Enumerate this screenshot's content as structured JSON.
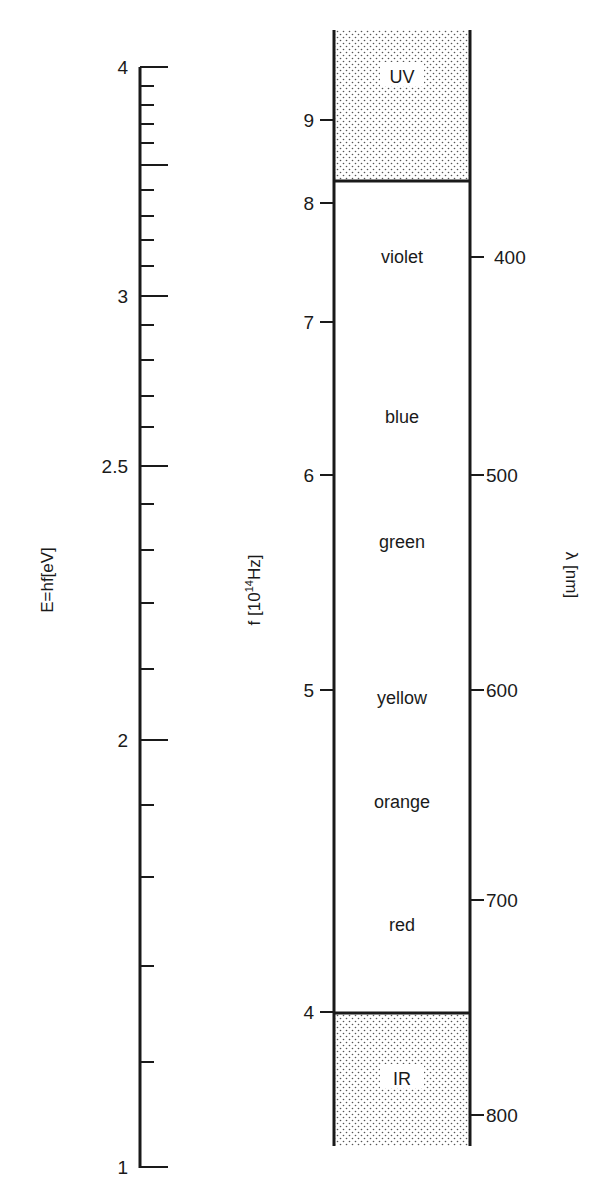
{
  "diagram": {
    "colors": {
      "ink": "#1a1a1a",
      "stipple": "#555555",
      "background": "#ffffff"
    },
    "energy_axis": {
      "title": "E=hf[eV]",
      "x": 140,
      "y_top": 67,
      "y_bottom": 1168,
      "major_ticks": [
        {
          "label": "4",
          "y": 67
        },
        {
          "label": "3",
          "y": 296
        },
        {
          "label": "2.5",
          "y": 466
        },
        {
          "label": "2",
          "y": 740
        },
        {
          "label": "1",
          "y": 1167
        }
      ],
      "minor_ticks_y": [
        86,
        105,
        124,
        143,
        165,
        190,
        216,
        240,
        266,
        325,
        360,
        396,
        427,
        504,
        550,
        603,
        669,
        805,
        877,
        966,
        1062
      ],
      "long_minor_ticks_y": [
        165
      ]
    },
    "frequency_axis": {
      "title": "f [10",
      "title_sup": "14",
      "title_end": "Hz]",
      "x": 334,
      "ticks": [
        {
          "label": "9",
          "y": 120
        },
        {
          "label": "8",
          "y": 203
        },
        {
          "label": "7",
          "y": 322
        },
        {
          "label": "6",
          "y": 475
        },
        {
          "label": "5",
          "y": 690
        },
        {
          "label": "4",
          "y": 1012
        }
      ]
    },
    "wavelength_axis": {
      "title": "λ [nm]",
      "x": 470,
      "ticks": [
        {
          "label": "400",
          "y": 257
        },
        {
          "label": "500",
          "y": 475
        },
        {
          "label": "600",
          "y": 690
        },
        {
          "label": "700",
          "y": 900
        },
        {
          "label": "800",
          "y": 1115
        }
      ]
    },
    "spectrum_bar": {
      "x_left": 334,
      "x_right": 470,
      "y_top": 30,
      "y_bottom": 1146,
      "uv_boundary_y": 181,
      "ir_boundary_y": 1013,
      "bands": [
        {
          "label": "UV",
          "y": 78,
          "region": "ultraviolet"
        },
        {
          "label": "violet",
          "y": 258
        },
        {
          "label": "blue",
          "y": 418
        },
        {
          "label": "green",
          "y": 543
        },
        {
          "label": "yellow",
          "y": 699
        },
        {
          "label": "orange",
          "y": 803
        },
        {
          "label": "red",
          "y": 926
        },
        {
          "label": "IR",
          "y": 1080,
          "region": "infrared"
        }
      ]
    }
  }
}
